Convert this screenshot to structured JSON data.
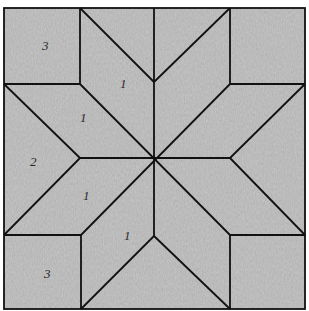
{
  "diagram": {
    "type": "quilt-block",
    "pattern": "eight-point-star",
    "colors": {
      "fabric": "#c9c9c9",
      "fabric_dark": "#b9b9b9",
      "fabric_light": "#d6d6d6",
      "line": "#111111",
      "label": "#2a2a2a"
    },
    "bounds": {
      "x0": 4,
      "y0": 8,
      "x1": 305,
      "y1": 309
    },
    "center": {
      "x": 154,
      "y": 158
    },
    "labels": [
      {
        "id": "top-left-square",
        "text": "3",
        "x": 42,
        "y": 50
      },
      {
        "id": "upper-diamond",
        "text": "1",
        "x": 120,
        "y": 88
      },
      {
        "id": "left-upper-diamond",
        "text": "1",
        "x": 80,
        "y": 122
      },
      {
        "id": "left-triangle",
        "text": "2",
        "x": 30,
        "y": 166
      },
      {
        "id": "left-lower-diamond",
        "text": "1",
        "x": 83,
        "y": 200
      },
      {
        "id": "lower-diamond",
        "text": "1",
        "x": 124,
        "y": 240
      },
      {
        "id": "bottom-left-square",
        "text": "3",
        "x": 44,
        "y": 278
      }
    ]
  }
}
